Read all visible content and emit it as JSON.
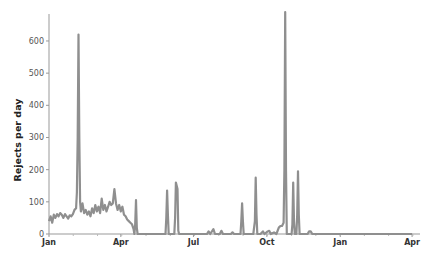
{
  "chart_data": {
    "type": "line",
    "title": "",
    "xlabel": "",
    "ylabel": "Rejects per day",
    "ylim": [
      0,
      690
    ],
    "yticks": [
      0,
      100,
      200,
      300,
      400,
      500,
      600
    ],
    "xticks": [
      {
        "label": "Jan",
        "day": 0
      },
      {
        "label": "Apr",
        "day": 90
      },
      {
        "label": "Jul",
        "day": 181
      },
      {
        "label": "Oct",
        "day": 273
      },
      {
        "label": "Jan",
        "day": 365
      },
      {
        "label": "Apr",
        "day": 455
      }
    ],
    "grid": false,
    "legend": null,
    "line_color": "#8f8f8f",
    "series": [
      {
        "name": "Rejects per day",
        "x_unit": "day since first Jan",
        "points": [
          [
            0,
            40
          ],
          [
            2,
            55
          ],
          [
            4,
            35
          ],
          [
            6,
            60
          ],
          [
            8,
            50
          ],
          [
            10,
            62
          ],
          [
            12,
            55
          ],
          [
            14,
            65
          ],
          [
            16,
            60
          ],
          [
            18,
            50
          ],
          [
            20,
            62
          ],
          [
            22,
            55
          ],
          [
            24,
            48
          ],
          [
            26,
            58
          ],
          [
            28,
            55
          ],
          [
            30,
            62
          ],
          [
            32,
            75
          ],
          [
            34,
            80
          ],
          [
            35,
            130
          ],
          [
            36,
            300
          ],
          [
            37,
            620
          ],
          [
            38,
            300
          ],
          [
            39,
            100
          ],
          [
            40,
            70
          ],
          [
            42,
            95
          ],
          [
            44,
            65
          ],
          [
            46,
            75
          ],
          [
            48,
            60
          ],
          [
            50,
            70
          ],
          [
            52,
            55
          ],
          [
            54,
            80
          ],
          [
            56,
            65
          ],
          [
            58,
            90
          ],
          [
            60,
            70
          ],
          [
            62,
            85
          ],
          [
            64,
            65
          ],
          [
            66,
            110
          ],
          [
            68,
            75
          ],
          [
            70,
            90
          ],
          [
            72,
            70
          ],
          [
            74,
            85
          ],
          [
            76,
            100
          ],
          [
            78,
            90
          ],
          [
            80,
            95
          ],
          [
            82,
            140
          ],
          [
            84,
            95
          ],
          [
            86,
            75
          ],
          [
            88,
            90
          ],
          [
            90,
            70
          ],
          [
            92,
            85
          ],
          [
            94,
            60
          ],
          [
            96,
            55
          ],
          [
            98,
            45
          ],
          [
            100,
            40
          ],
          [
            102,
            35
          ],
          [
            104,
            30
          ],
          [
            106,
            15
          ],
          [
            107,
            0
          ],
          [
            108,
            30
          ],
          [
            109,
            105
          ],
          [
            110,
            20
          ],
          [
            111,
            0
          ],
          [
            114,
            0
          ],
          [
            118,
            0
          ],
          [
            124,
            0
          ],
          [
            130,
            0
          ],
          [
            136,
            0
          ],
          [
            140,
            0
          ],
          [
            144,
            0
          ],
          [
            146,
            0
          ],
          [
            147,
            50
          ],
          [
            148,
            135
          ],
          [
            149,
            60
          ],
          [
            150,
            0
          ],
          [
            155,
            0
          ],
          [
            157,
            0
          ],
          [
            158,
            50
          ],
          [
            159,
            160
          ],
          [
            160,
            150
          ],
          [
            161,
            140
          ],
          [
            162,
            10
          ],
          [
            163,
            0
          ],
          [
            170,
            0
          ],
          [
            180,
            0
          ],
          [
            190,
            0
          ],
          [
            198,
            0
          ],
          [
            200,
            8
          ],
          [
            202,
            0
          ],
          [
            206,
            15
          ],
          [
            208,
            0
          ],
          [
            214,
            0
          ],
          [
            216,
            10
          ],
          [
            218,
            0
          ],
          [
            228,
            0
          ],
          [
            230,
            5
          ],
          [
            232,
            0
          ],
          [
            240,
            0
          ],
          [
            241,
            40
          ],
          [
            242,
            95
          ],
          [
            243,
            40
          ],
          [
            244,
            0
          ],
          [
            250,
            0
          ],
          [
            256,
            0
          ],
          [
            258,
            40
          ],
          [
            259,
            175
          ],
          [
            260,
            60
          ],
          [
            261,
            0
          ],
          [
            265,
            0
          ],
          [
            268,
            8
          ],
          [
            270,
            0
          ],
          [
            274,
            8
          ],
          [
            276,
            10
          ],
          [
            278,
            0
          ],
          [
            282,
            5
          ],
          [
            285,
            0
          ],
          [
            288,
            20
          ],
          [
            290,
            25
          ],
          [
            292,
            25
          ],
          [
            294,
            35
          ],
          [
            295,
            200
          ],
          [
            296,
            690
          ],
          [
            297,
            200
          ],
          [
            298,
            0
          ],
          [
            304,
            0
          ],
          [
            305,
            30
          ],
          [
            306,
            160
          ],
          [
            307,
            40
          ],
          [
            308,
            0
          ],
          [
            310,
            0
          ],
          [
            311,
            60
          ],
          [
            312,
            195
          ],
          [
            313,
            60
          ],
          [
            314,
            0
          ],
          [
            320,
            0
          ],
          [
            324,
            0
          ],
          [
            326,
            8
          ],
          [
            328,
            8
          ],
          [
            330,
            0
          ],
          [
            340,
            0
          ],
          [
            360,
            0
          ],
          [
            380,
            0
          ],
          [
            400,
            0
          ],
          [
            420,
            0
          ],
          [
            440,
            0
          ],
          [
            455,
            0
          ]
        ]
      }
    ]
  },
  "axis": {
    "ylabel": "Rejects per day"
  }
}
